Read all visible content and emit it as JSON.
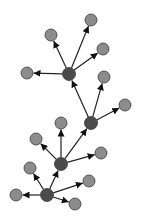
{
  "diagram": {
    "type": "directed-tree",
    "colors": {
      "hub_fill": "#4b4b4b",
      "leaf_fill": "#8c8c8c",
      "stroke": "#3a3a3a",
      "edge": "#222222"
    },
    "node_radius": {
      "hub": 6.5,
      "leaf": 6
    },
    "nodes": [
      {
        "id": "h1",
        "kind": "hub",
        "x": 69,
        "y": 74
      },
      {
        "id": "h2",
        "kind": "hub",
        "x": 91,
        "y": 123
      },
      {
        "id": "h3",
        "kind": "hub",
        "x": 61,
        "y": 164
      },
      {
        "id": "h4",
        "kind": "hub",
        "x": 47,
        "y": 195
      },
      {
        "id": "l1",
        "kind": "leaf",
        "x": 91,
        "y": 20
      },
      {
        "id": "l2",
        "kind": "leaf",
        "x": 51,
        "y": 35
      },
      {
        "id": "l3",
        "kind": "leaf",
        "x": 103,
        "y": 49
      },
      {
        "id": "l4",
        "kind": "leaf",
        "x": 27,
        "y": 73
      },
      {
        "id": "l5",
        "kind": "leaf",
        "x": 104,
        "y": 77
      },
      {
        "id": "l6",
        "kind": "leaf",
        "x": 125,
        "y": 105
      },
      {
        "id": "l7",
        "kind": "leaf",
        "x": 61,
        "y": 123
      },
      {
        "id": "l8",
        "kind": "leaf",
        "x": 36,
        "y": 139
      },
      {
        "id": "l9",
        "kind": "leaf",
        "x": 101,
        "y": 153
      },
      {
        "id": "l10",
        "kind": "leaf",
        "x": 30,
        "y": 168
      },
      {
        "id": "l11",
        "kind": "leaf",
        "x": 16,
        "y": 195
      },
      {
        "id": "l12",
        "kind": "leaf",
        "x": 89,
        "y": 181
      },
      {
        "id": "l13",
        "kind": "leaf",
        "x": 75,
        "y": 204
      }
    ],
    "edges": [
      {
        "from": "h1",
        "to": "l1"
      },
      {
        "from": "h1",
        "to": "l2"
      },
      {
        "from": "h1",
        "to": "l3"
      },
      {
        "from": "h1",
        "to": "l4"
      },
      {
        "from": "h2",
        "to": "h1"
      },
      {
        "from": "h2",
        "to": "l5"
      },
      {
        "from": "h2",
        "to": "l6"
      },
      {
        "from": "h3",
        "to": "h2"
      },
      {
        "from": "h3",
        "to": "l7"
      },
      {
        "from": "h3",
        "to": "l8"
      },
      {
        "from": "h3",
        "to": "l9"
      },
      {
        "from": "h4",
        "to": "h3"
      },
      {
        "from": "h4",
        "to": "l10"
      },
      {
        "from": "h4",
        "to": "l11"
      },
      {
        "from": "h4",
        "to": "l12"
      },
      {
        "from": "h4",
        "to": "l13"
      }
    ]
  }
}
